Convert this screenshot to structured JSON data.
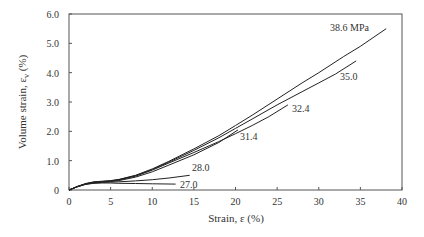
{
  "chart_data": {
    "type": "line",
    "title": "",
    "xlabel": "Strain, ε (%)",
    "ylabel": "Volume strain, ε",
    "ylabel_sub": "v",
    "ylabel_unit": " (%)",
    "xlim": [
      0,
      40
    ],
    "ylim": [
      0,
      6.0
    ],
    "xticks": [
      0,
      5,
      10,
      15,
      20,
      25,
      30,
      35,
      40
    ],
    "xtick_labels": [
      "0",
      "5",
      "10",
      "15",
      "20",
      "25",
      "30",
      "35",
      "40"
    ],
    "yticks": [
      0,
      1,
      2,
      3,
      4,
      5,
      6
    ],
    "ytick_labels": [
      "0",
      "1.0",
      "2.0",
      "3.0",
      "4.0",
      "5.0",
      "6.0"
    ],
    "grid": false,
    "legend": "inline labels at curve ends",
    "series": [
      {
        "name": "38.6 MPa",
        "x": [
          0,
          1,
          2,
          3,
          4,
          5,
          6,
          8,
          10,
          12,
          15,
          18,
          20,
          22,
          25,
          28,
          30,
          33,
          35,
          38.1
        ],
        "y": [
          0,
          0.12,
          0.22,
          0.28,
          0.3,
          0.32,
          0.36,
          0.5,
          0.72,
          0.98,
          1.4,
          1.85,
          2.2,
          2.55,
          3.1,
          3.65,
          4.0,
          4.55,
          4.9,
          5.5
        ],
        "label_pos": [
          330,
          31
        ]
      },
      {
        "name": "35.0",
        "x": [
          0,
          1,
          2,
          3,
          4,
          5,
          6,
          8,
          10,
          12,
          15,
          18,
          20,
          22,
          25,
          28,
          30,
          32,
          34.5
        ],
        "y": [
          0,
          0.12,
          0.21,
          0.27,
          0.29,
          0.31,
          0.35,
          0.49,
          0.7,
          0.95,
          1.35,
          1.78,
          2.1,
          2.42,
          2.9,
          3.35,
          3.65,
          3.95,
          4.4
        ],
        "label_pos": [
          340,
          80
        ]
      },
      {
        "name": "32.4",
        "x": [
          0,
          1,
          2,
          3,
          4,
          5,
          6,
          8,
          10,
          12,
          15,
          18,
          20,
          22,
          24,
          26.3
        ],
        "y": [
          0,
          0.12,
          0.21,
          0.26,
          0.28,
          0.3,
          0.34,
          0.47,
          0.68,
          0.92,
          1.28,
          1.65,
          1.92,
          2.2,
          2.5,
          2.9
        ],
        "label_pos": [
          292,
          112
        ]
      },
      {
        "name": "31.4",
        "x": [
          0,
          1,
          2,
          3,
          4,
          5,
          6,
          8,
          10,
          12,
          15,
          18,
          20.3
        ],
        "y": [
          0,
          0.11,
          0.2,
          0.25,
          0.27,
          0.29,
          0.32,
          0.44,
          0.62,
          0.85,
          1.2,
          1.62,
          2.05
        ],
        "label_pos": [
          240,
          140
        ]
      },
      {
        "name": "28.0",
        "x": [
          0,
          1,
          2,
          3,
          4,
          5,
          6,
          8,
          10,
          12,
          14.5
        ],
        "y": [
          0,
          0.11,
          0.2,
          0.24,
          0.26,
          0.27,
          0.28,
          0.31,
          0.35,
          0.41,
          0.5
        ],
        "label_pos": [
          192,
          171
        ]
      },
      {
        "name": "27.0",
        "x": [
          0,
          1,
          2,
          3,
          4,
          5,
          6,
          8,
          10,
          12.8
        ],
        "y": [
          0,
          0.11,
          0.19,
          0.23,
          0.24,
          0.24,
          0.23,
          0.22,
          0.21,
          0.2
        ],
        "label_pos": [
          180,
          188
        ]
      }
    ]
  }
}
